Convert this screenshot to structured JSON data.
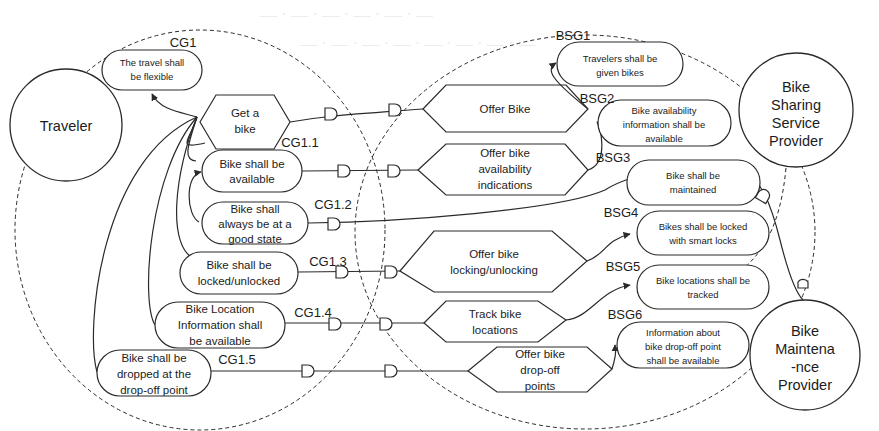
{
  "actors": [
    {
      "id": "traveler",
      "lines": [
        "Traveler"
      ]
    },
    {
      "id": "bike-sharing-service-provider",
      "lines": [
        "Bike",
        "Sharing",
        "Service",
        "Provider"
      ]
    },
    {
      "id": "bike-maintenance-provider",
      "lines": [
        "Bike",
        "Maintena",
        "-nce",
        "Provider"
      ]
    }
  ],
  "traveler_goals": [
    {
      "label": "CG1",
      "lines": [
        "The travel shall",
        "be flexible"
      ]
    },
    {
      "label": "CG1.1",
      "lines": [
        "Bike shall be",
        "available"
      ]
    },
    {
      "label": "CG1.2",
      "lines": [
        "Bike shall",
        "always be at a",
        "good state"
      ]
    },
    {
      "label": "CG1.3",
      "lines": [
        "Bike shall be",
        "locked/unlocked"
      ]
    },
    {
      "label": "CG1.4",
      "lines": [
        "Bike Location",
        "Information shall",
        "be available"
      ]
    },
    {
      "label": "CG1.5",
      "lines": [
        "Bike shall be",
        "dropped at the",
        "drop-off point"
      ]
    }
  ],
  "traveler_tasks": [
    {
      "id": "get-a-bike",
      "lines": [
        "Get a",
        "bike"
      ]
    }
  ],
  "provider_goals": [
    {
      "label": "BSG1",
      "lines": [
        "Travelers shall be",
        "given bikes"
      ]
    },
    {
      "label": "BSG2",
      "lines": [
        "Bike availability",
        "information shall be",
        "available"
      ]
    },
    {
      "label": "BSG3",
      "lines": [
        "Bike shall be",
        "maintained"
      ]
    },
    {
      "label": "BSG4",
      "lines": [
        "Bikes shall be locked",
        "with smart locks"
      ]
    },
    {
      "label": "BSG5",
      "lines": [
        "Bike locations shall be",
        "tracked"
      ]
    },
    {
      "label": "BSG6",
      "lines": [
        "Information about",
        "bike drop-off point",
        "shall be available"
      ]
    }
  ],
  "provider_tasks": [
    {
      "id": "offer-bike",
      "lines": [
        "Offer Bike"
      ]
    },
    {
      "id": "offer-bike-availability-indications",
      "lines": [
        "Offer bike",
        "availability",
        "indications"
      ]
    },
    {
      "id": "offer-bike-locking-unlocking",
      "lines": [
        "Offer bike",
        "locking/unlocking"
      ]
    },
    {
      "id": "track-bike-locations",
      "lines": [
        "Track bike",
        "locations"
      ]
    },
    {
      "id": "offer-bike-drop-off-points",
      "lines": [
        "Offer bike",
        "drop-off",
        "points"
      ]
    }
  ],
  "colors": {
    "stroke": "#2a2a2a",
    "background": "#ffffff",
    "faint_text": "#ececec"
  }
}
